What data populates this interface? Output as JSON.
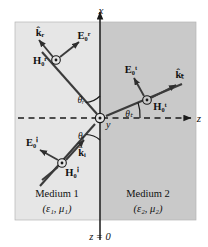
{
  "figure": {
    "title_implicit": "Oblique incidence: reflection and transmission at a planar boundary",
    "axes": {
      "x_label": "x",
      "z_label": "z",
      "y_label": "y",
      "boundary_label": "z = 0"
    },
    "media": [
      {
        "name": "Medium 1",
        "params": "(ε₁, μ₁)",
        "side": "left",
        "fill": "#e6e6e6"
      },
      {
        "name": "Medium 2",
        "params": "(ε₂, μ₂)",
        "side": "right",
        "fill": "#c9c9c9"
      }
    ],
    "angles": [
      {
        "id": "theta-r",
        "label": "θᵣ",
        "meaning": "angle of reflection"
      },
      {
        "id": "theta-i",
        "label": "θᵢ",
        "meaning": "angle of incidence"
      },
      {
        "id": "theta-t",
        "label": "θₜ",
        "meaning": "angle of transmission"
      }
    ],
    "waves": [
      {
        "id": "incident",
        "propagation_label": "k̂ᵢ",
        "e_field_label": "E₀ⁱ",
        "h_field_label": "H₀ⁱ",
        "h_symbol": "circled-dot-out-of-page"
      },
      {
        "id": "reflected",
        "propagation_label": "k̂ᵣ",
        "e_field_label": "E₀ʳ",
        "h_field_label": "H₀ʳ",
        "h_symbol": "circled-dot-out-of-page"
      },
      {
        "id": "transmitted",
        "propagation_label": "k̂ₜ",
        "e_field_label": "E₀ᵗ",
        "h_field_label": "H₀ᵗ",
        "h_symbol": "circled-dot-out-of-page"
      }
    ],
    "colors": {
      "medium1": "#e6e6e6",
      "medium2": "#c9c9c9",
      "ray": "#3b3b3b",
      "axis": "#1a1a1a",
      "text": "#111111",
      "page": "#ffffff"
    }
  }
}
